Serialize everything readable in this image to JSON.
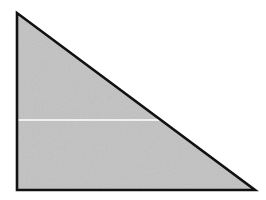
{
  "diagram": {
    "type": "right-triangle",
    "width": 266,
    "height": 200,
    "background": "#ffffff",
    "triangle": {
      "points": "17,13 17,190 255,190",
      "fill": "#c2c2c2",
      "stroke": "#111111",
      "stroke_width": 2.6
    },
    "cut_line": {
      "x1": 18,
      "y1": 120,
      "x2": 160,
      "y2": 120,
      "stroke": "#ffffff",
      "stroke_width": 1.4
    }
  }
}
